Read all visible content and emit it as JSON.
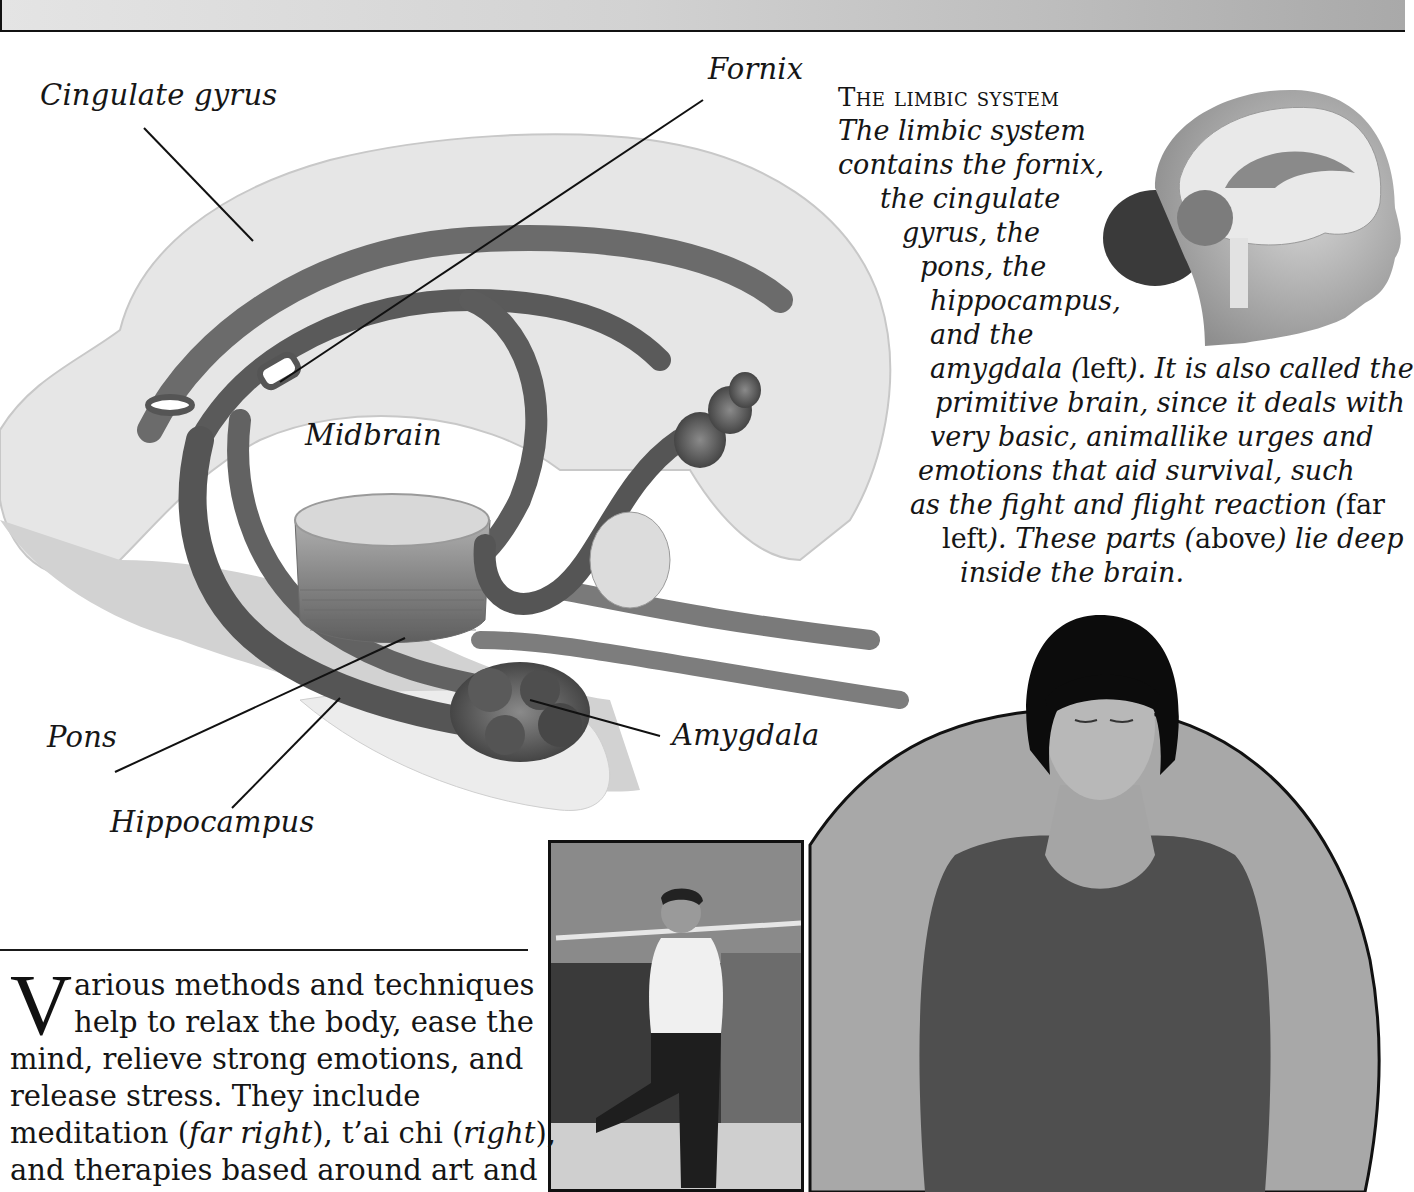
{
  "header": {
    "text": ""
  },
  "diagram": {
    "labels": {
      "cingulate_gyrus": "Cingulate gyrus",
      "fornix": "Fornix",
      "midbrain": "Midbrain",
      "pons": "Pons",
      "amygdala": "Amygdala",
      "hippocampus": "Hippocampus"
    },
    "colors": {
      "cortex_fill": "#e3e3e3",
      "tract_fill": "#6c6c6c",
      "tract_dark": "#4a4a4a",
      "leader_line": "#111111"
    }
  },
  "caption": {
    "heading": "The limbic system",
    "lines": [
      "The limbic system",
      "contains the fornix,",
      "the cingulate",
      "gyrus, the",
      "pons, the",
      "hippocampus,",
      "and the"
    ],
    "line8_a": "amygdala (",
    "line8_b": "left",
    "line8_c": "). It is also called the",
    "line9": "primitive brain, since it deals with",
    "line10": "very basic, animallike urges and",
    "line11": "emotions that aid survival, such",
    "line12_a": "as the fight and flight reaction (",
    "line12_b": "far",
    "line13_a": "left",
    "line13_b": "). These parts (",
    "line13_c": "above",
    "line13_d": ") lie deep",
    "line14": "inside the brain."
  },
  "body": {
    "dropcap": "V",
    "line1": "arious methods and techniques",
    "line2": "help to relax the body, ease the",
    "line3": "mind, relieve strong emotions, and",
    "line4": "release stress. They include",
    "line5_a": "meditation (",
    "line5_b": "far right",
    "line5_c": "), t’ai chi (",
    "line5_d": "right",
    "line5_e": "),",
    "line6": "and therapies based around art and"
  },
  "photos": {
    "head_illustration": "Girl's head with brain cross-section",
    "taichi": "Man practicing t'ai chi with staff",
    "meditation": "Woman meditating with eyes closed"
  }
}
